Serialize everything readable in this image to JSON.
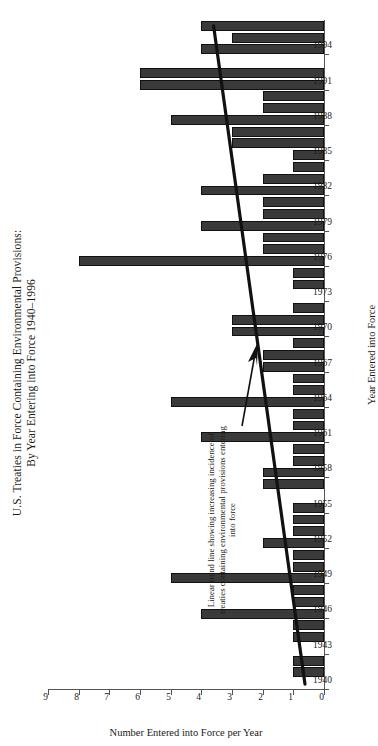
{
  "figure": {
    "title_line1": "U.S. Treaties in Force Containing Environmental Provisions:",
    "title_line2": "By Year Entering into Force 1940–1996",
    "annotation": "Linear trend line showing increasing incidence of treaties containing environmental provisions entering into force",
    "bar_color": "#3a3a3a",
    "trend_color": "#111111",
    "axis_color": "#555555"
  },
  "chart_data": {
    "type": "bar",
    "title": "U.S. Treaties in Force Containing Environmental Provisions: By Year Entering into Force 1940–1996",
    "xlabel": "Year Entered into Force",
    "ylabel": "Number Entered into Force per Year",
    "ylim": [
      0,
      9
    ],
    "ytick_labels": [
      "0",
      "1",
      "2",
      "3",
      "4",
      "5",
      "6",
      "7",
      "8",
      "9"
    ],
    "yticks": [
      0,
      1,
      2,
      3,
      4,
      5,
      6,
      7,
      8,
      9
    ],
    "xtick_labels": [
      "1940",
      "1943",
      "1946",
      "1949",
      "1952",
      "1955",
      "1958",
      "1961",
      "1964",
      "1967",
      "1970",
      "1973",
      "1976",
      "1979",
      "1982",
      "1985",
      "1988",
      "1991",
      "1994"
    ],
    "xticks": [
      1940,
      1943,
      1946,
      1949,
      1952,
      1955,
      1958,
      1961,
      1964,
      1967,
      1970,
      1973,
      1976,
      1979,
      1982,
      1985,
      1988,
      1991,
      1994
    ],
    "grid": false,
    "legend": "none",
    "categories": [
      1940,
      1941,
      1942,
      1943,
      1944,
      1945,
      1946,
      1947,
      1948,
      1949,
      1950,
      1951,
      1952,
      1953,
      1954,
      1955,
      1956,
      1957,
      1958,
      1959,
      1960,
      1961,
      1962,
      1963,
      1964,
      1965,
      1966,
      1967,
      1968,
      1969,
      1970,
      1971,
      1972,
      1973,
      1974,
      1975,
      1976,
      1977,
      1978,
      1979,
      1980,
      1981,
      1982,
      1983,
      1984,
      1985,
      1986,
      1987,
      1988,
      1989,
      1990,
      1991,
      1992,
      1993,
      1994,
      1995,
      1996
    ],
    "values": [
      0,
      1,
      1,
      0,
      1,
      1,
      4,
      1,
      1,
      5,
      1,
      1,
      2,
      1,
      1,
      1,
      0,
      2,
      2,
      1,
      1,
      4,
      1,
      1,
      5,
      1,
      1,
      2,
      2,
      1,
      3,
      3,
      1,
      0,
      1,
      1,
      8,
      2,
      2,
      4,
      2,
      2,
      4,
      2,
      1,
      1,
      3,
      3,
      5,
      2,
      2,
      6,
      6,
      0,
      4,
      3,
      4
    ],
    "trendline": {
      "name": "Linear trend line",
      "x_start": 1940,
      "y_start": 0.62,
      "x_end": 1996,
      "y_end": 3.6
    }
  }
}
